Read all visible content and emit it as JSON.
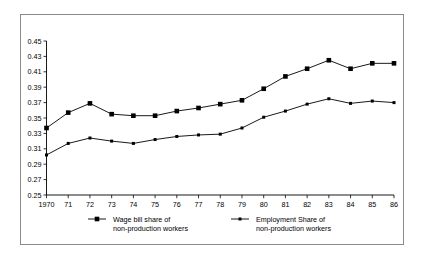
{
  "chart_data": {
    "type": "line",
    "title": "",
    "subtitle": "",
    "xlabel": "",
    "ylabel": "",
    "xlim": [
      1970,
      1986
    ],
    "ylim": [
      0.25,
      0.45
    ],
    "ytick_step": 0.02,
    "grid": false,
    "legend_position": "bottom",
    "x": [
      1970,
      1971,
      1972,
      1973,
      1974,
      1975,
      1976,
      1977,
      1978,
      1979,
      1980,
      1981,
      1982,
      1983,
      1984,
      1985,
      1986
    ],
    "xtick_labels": [
      "1970",
      "71",
      "72",
      "73",
      "74",
      "75",
      "76",
      "77",
      "78",
      "79",
      "80",
      "81",
      "82",
      "83",
      "84",
      "85",
      "86"
    ],
    "ytick_labels": [
      "0.45",
      "0.43",
      "0.41",
      "0.39",
      "0.37",
      "0.35",
      "0.33",
      "0.31",
      "0.29",
      "0.27",
      "0.25"
    ],
    "ytick_values": [
      0.45,
      0.43,
      0.41,
      0.39,
      0.37,
      0.35,
      0.33,
      0.31,
      0.29,
      0.27,
      0.25
    ],
    "series": [
      {
        "name": "Wage bill share of non-production workers",
        "marker": "square-large",
        "values": [
          0.337,
          0.357,
          0.369,
          0.355,
          0.353,
          0.353,
          0.359,
          0.363,
          0.368,
          0.373,
          0.388,
          0.404,
          0.414,
          0.425,
          0.414,
          0.421,
          0.421
        ]
      },
      {
        "name": "Employment Share of non-production workers",
        "marker": "square-small",
        "values": [
          0.302,
          0.317,
          0.324,
          0.32,
          0.317,
          0.322,
          0.326,
          0.328,
          0.329,
          0.337,
          0.351,
          0.359,
          0.368,
          0.375,
          0.369,
          0.372,
          0.37
        ]
      }
    ],
    "legend": [
      {
        "line1": "Wage bill share of",
        "line2": "non-production workers",
        "marker": "square-large"
      },
      {
        "line1": "Employment Share of",
        "line2": "non-production workers",
        "marker": "square-small"
      }
    ],
    "colors": {
      "series_stroke": "#000000",
      "axis": "#000000",
      "frame": "#8a8a8a",
      "background": "#ffffff"
    }
  }
}
